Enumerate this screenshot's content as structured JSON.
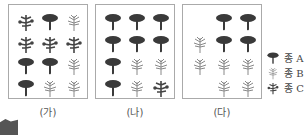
{
  "panels": [
    {
      "label": "(가)",
      "left": 8,
      "trees": [
        "C",
        "A",
        "B",
        "C",
        "C",
        "C",
        "A",
        "A",
        "B",
        "A",
        "B",
        "B"
      ]
    },
    {
      "label": "(나)",
      "left": 95,
      "trees": [
        "A",
        "A",
        "A",
        "A",
        "A",
        "A",
        "A",
        "B",
        "B",
        "A",
        "B",
        "C"
      ]
    },
    {
      "label": "(다)",
      "left": 182,
      "trees": [
        "_",
        "A",
        "A",
        "B",
        "A",
        "A",
        "B",
        "B",
        "B",
        "_",
        "B",
        "B"
      ]
    }
  ],
  "legend": [
    {
      "species": "A",
      "label": "종 A"
    },
    {
      "species": "B",
      "label": "종 B"
    },
    {
      "species": "C",
      "label": "종 C"
    }
  ],
  "colors": {
    "tree_a": "#3a3a3a",
    "tree_b": "#888888",
    "tree_c": "#444444",
    "border": "#aaaaaa"
  },
  "badge": {
    "text": "…"
  }
}
